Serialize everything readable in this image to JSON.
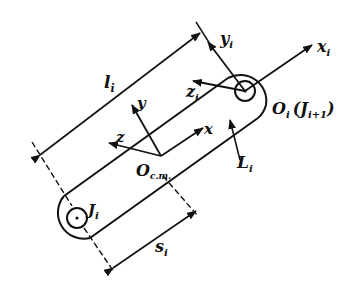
{
  "diagram": {
    "colors": {
      "ink": "#111111",
      "background": "#ffffff"
    },
    "labels": {
      "length": {
        "main": "l",
        "sub": "i"
      },
      "com_offset": {
        "main": "s",
        "sub": "i"
      },
      "link": {
        "main": "L",
        "sub": "i"
      },
      "joint_base": {
        "main": "J",
        "sub": "i"
      },
      "origin_frame": {
        "main": "O",
        "sub": "i",
        "paren_main": "(J",
        "paren_sub": "i+1",
        "paren_close": ")"
      },
      "com_origin": {
        "main": "O",
        "sub": "c.m."
      },
      "com_axes": {
        "x": "x",
        "y": "y",
        "z": "z"
      },
      "frame_axes": {
        "x": {
          "main": "x",
          "sub": "i"
        },
        "y": {
          "main": "y",
          "sub": "i"
        },
        "z": {
          "main": "z",
          "sub": "i"
        }
      }
    }
  }
}
